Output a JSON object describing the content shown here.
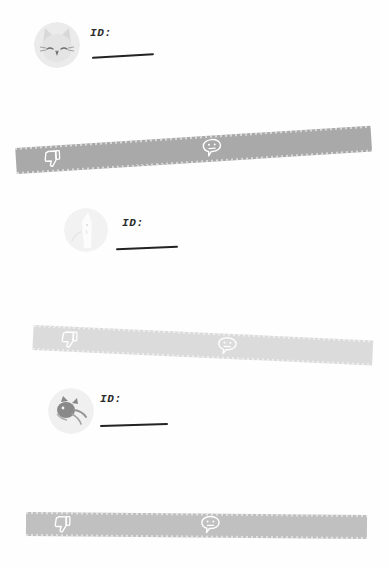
{
  "page": {
    "background_color": "#ffffff",
    "bar_color": "#a9a9a9",
    "ink_color": "#232323"
  },
  "entries": [
    {
      "avatar_name": "cat-face-avatar",
      "avatar_description": "squinting cat face",
      "id_label": "ID:",
      "id_value": "",
      "bar": {
        "thumbs_down_icon": "thumbs-down-icon",
        "speech_bubble_icon": "sad-speech-bubble-icon",
        "rotation_deg": -3.6
      }
    },
    {
      "avatar_name": "cat-ear-avatar",
      "avatar_description": "faded pointed-ear cat silhouette",
      "id_label": "ID:",
      "id_value": "",
      "bar": {
        "thumbs_down_icon": "thumbs-down-icon",
        "speech_bubble_icon": "sad-speech-bubble-icon",
        "rotation_deg": 2.6
      }
    },
    {
      "avatar_name": "dark-creature-avatar",
      "avatar_description": "dark creature face",
      "id_label": "ID:",
      "id_value": "",
      "bar": {
        "thumbs_down_icon": "thumbs-down-icon",
        "speech_bubble_icon": "sad-speech-bubble-icon",
        "rotation_deg": 0.5
      }
    }
  ]
}
